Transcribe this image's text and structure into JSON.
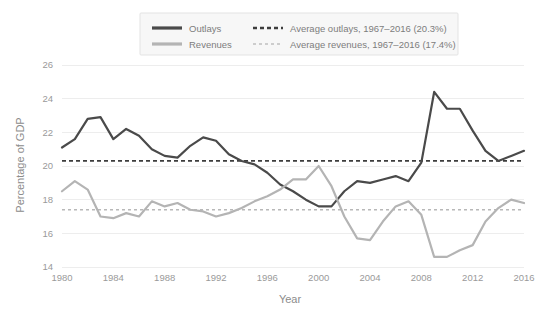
{
  "chart_data": {
    "type": "line",
    "title": "",
    "xlabel": "Year",
    "ylabel": "Percentage of GDP",
    "xlim": [
      1980,
      2016
    ],
    "ylim": [
      14,
      26
    ],
    "xticks": [
      1980,
      1984,
      1988,
      1992,
      1996,
      2000,
      2004,
      2008,
      2012,
      2016
    ],
    "yticks": [
      14,
      16,
      18,
      20,
      22,
      24,
      26
    ],
    "grid": true,
    "legend_position": "top-center",
    "x": [
      1980,
      1981,
      1982,
      1983,
      1984,
      1985,
      1986,
      1987,
      1988,
      1989,
      1990,
      1991,
      1992,
      1993,
      1994,
      1995,
      1996,
      1997,
      1998,
      1999,
      2000,
      2001,
      2002,
      2003,
      2004,
      2005,
      2006,
      2007,
      2008,
      2009,
      2010,
      2011,
      2012,
      2013,
      2014,
      2015,
      2016
    ],
    "series": [
      {
        "name": "Outlays",
        "color": "#4a4a4a",
        "width": 2.2,
        "values": [
          21.1,
          21.6,
          22.8,
          22.9,
          21.6,
          22.2,
          21.8,
          21.0,
          20.6,
          20.5,
          21.2,
          21.7,
          21.5,
          20.7,
          20.3,
          20.1,
          19.6,
          18.9,
          18.5,
          18.0,
          17.6,
          17.6,
          18.5,
          19.1,
          19.0,
          19.2,
          19.4,
          19.1,
          20.2,
          24.4,
          23.4,
          23.4,
          22.1,
          20.9,
          20.3,
          20.6,
          20.9
        ]
      },
      {
        "name": "Revenues",
        "color": "#b4b4b4",
        "width": 2.2,
        "values": [
          18.5,
          19.1,
          18.6,
          17.0,
          16.9,
          17.2,
          17.0,
          17.9,
          17.6,
          17.8,
          17.4,
          17.3,
          17.0,
          17.2,
          17.5,
          17.9,
          18.2,
          18.6,
          19.2,
          19.2,
          20.0,
          18.8,
          17.0,
          15.7,
          15.6,
          16.7,
          17.6,
          17.9,
          17.1,
          14.6,
          14.6,
          15.0,
          15.3,
          16.7,
          17.5,
          18.0,
          17.8
        ]
      }
    ],
    "average_lines": [
      {
        "name": "Average outlays, 1967-2016",
        "value": 20.3,
        "color": "#3d3d3d",
        "dash": "4,3",
        "width": 1.8
      },
      {
        "name": "Average revenues, 1967-2016",
        "value": 17.4,
        "color": "#b8b8b8",
        "dash": "3,3",
        "width": 1.4
      }
    ]
  },
  "legend": {
    "entries": [
      {
        "label": "Outlays",
        "swatch": "solid-dark-line-swatch"
      },
      {
        "label": "Revenues",
        "swatch": "solid-light-line-swatch"
      },
      {
        "label": "Average outlays, 1967–2016 (20.3%)",
        "swatch": "dashed-dark-line-swatch"
      },
      {
        "label": "Average revenues, 1967–2016 (17.4%)",
        "swatch": "dashed-light-line-swatch"
      }
    ]
  },
  "axes": {
    "x_title": "Year",
    "y_title": "Percentage of GDP",
    "x_tick_labels": [
      "1980",
      "1984",
      "1988",
      "1992",
      "1996",
      "2000",
      "2004",
      "2008",
      "2012",
      "2016"
    ],
    "y_tick_labels": [
      "14",
      "16",
      "18",
      "20",
      "22",
      "24",
      "26"
    ]
  }
}
